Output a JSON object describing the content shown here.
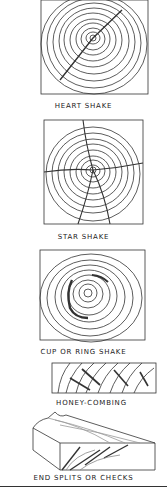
{
  "figures": [
    {
      "id": "heart-shake",
      "label": "HEART SHAKE"
    },
    {
      "id": "star-shake",
      "label": "STAR SHAKE"
    },
    {
      "id": "cup-ring-shake",
      "label": "CUP OR RING SHAKE"
    },
    {
      "id": "honey-combing",
      "label": "HONEY-COMBING"
    },
    {
      "id": "end-splits",
      "label": "END SPLITS OR CHECKS"
    }
  ],
  "colors": {
    "ink": "#222222",
    "background": "#ffffff"
  }
}
